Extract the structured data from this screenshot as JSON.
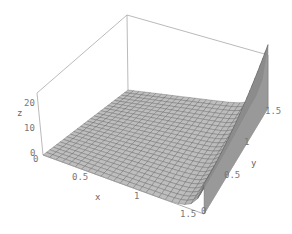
{
  "chart_data": {
    "type": "surface3d",
    "title": "",
    "xlabel": "x",
    "ylabel": "y",
    "zlabel": "z",
    "xlim": [
      0,
      1.5
    ],
    "ylim": [
      0,
      1.5
    ],
    "zlim": [
      0,
      25
    ],
    "x_ticks": [
      "0",
      "0.5",
      "1",
      "1.5"
    ],
    "y_ticks": [
      "0",
      "0.5",
      "1",
      "1.5"
    ],
    "z_ticks": [
      "0",
      "10",
      "20"
    ],
    "grid": false,
    "boxed": true,
    "mesh": {
      "nx": 25,
      "ny": 25
    },
    "surface_description": "Nearly flat surface z≈0 over most of the domain, rising steeply to ~25 along the edge x=1.5 (steepest near y=1.5), with a sharp ridge along x near 1.5",
    "sample_points": [
      {
        "x": 0,
        "y": 0,
        "z": 0
      },
      {
        "x": 0.5,
        "y": 0.5,
        "z": 0.1
      },
      {
        "x": 1.0,
        "y": 1.0,
        "z": 0.5
      },
      {
        "x": 1.3,
        "y": 0.5,
        "z": 2
      },
      {
        "x": 1.5,
        "y": 0,
        "z": 12
      },
      {
        "x": 1.5,
        "y": 0.75,
        "z": 14
      },
      {
        "x": 1.5,
        "y": 1.5,
        "z": 25
      }
    ],
    "colors": {
      "surface": "#b8b8b8",
      "mesh": "#555555",
      "box": "#9a9a9a",
      "text": "#777777"
    }
  },
  "labels": {
    "x": "x",
    "y": "y",
    "z": "z",
    "xt0": "0",
    "xt1": "0.5",
    "xt2": "1",
    "xt3": "1.5",
    "yt0": "0",
    "yt1": "0.5",
    "yt2": "1",
    "yt3": "1.5",
    "zt0": "0",
    "zt1": "10",
    "zt2": "20"
  }
}
